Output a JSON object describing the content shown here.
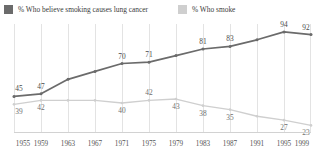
{
  "legend": {
    "items": [
      {
        "label": "% Who believe smoking causes lung cancer",
        "color": "#6b6b6b",
        "key": "believe"
      },
      {
        "label": "% Who smoke",
        "color": "#cfcfcf",
        "key": "smoke"
      }
    ]
  },
  "chart_data": {
    "type": "line",
    "title": "",
    "subtitle": "",
    "xlabel": "",
    "ylabel": "",
    "grid": true,
    "legend_position": "top-left",
    "x": [
      1955,
      1959,
      1963,
      1967,
      1971,
      1975,
      1979,
      1983,
      1987,
      1991,
      1995,
      1999
    ],
    "xtick_labels": [
      "1955",
      "1959",
      "1963",
      "1967",
      "1971",
      "1975",
      "1979",
      "1983",
      "1987",
      "1991",
      "1995",
      "1999"
    ],
    "xlim": [
      1955,
      1999
    ],
    "ylim": [
      18,
      100
    ],
    "series": [
      {
        "name": "% Who believe smoking causes lung cancer",
        "color": "#6b6b6b",
        "values": [
          45,
          47,
          58,
          64,
          70,
          71,
          76,
          81,
          83,
          88,
          94,
          92
        ],
        "labels": [
          "45",
          "47",
          "",
          "",
          "70",
          "71",
          "",
          "81",
          "83",
          "",
          "94",
          "92"
        ],
        "label_positions": [
          "above",
          "above",
          "",
          "",
          "above",
          "above",
          "",
          "above",
          "above",
          "",
          "above",
          "above"
        ]
      },
      {
        "name": "% Who smoke",
        "color": "#cfcfcf",
        "values": [
          39,
          42,
          42,
          42,
          40,
          42,
          43,
          38,
          35,
          30,
          27,
          23
        ],
        "labels": [
          "39",
          "42",
          "",
          "",
          "40",
          "42",
          "43",
          "38",
          "35",
          "",
          "27",
          "23"
        ],
        "label_positions": [
          "below",
          "below",
          "",
          "",
          "below",
          "above",
          "below",
          "below",
          "below",
          "",
          "below",
          "below"
        ]
      }
    ]
  }
}
